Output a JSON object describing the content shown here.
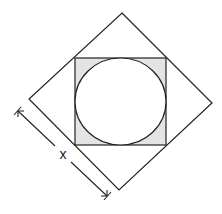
{
  "diagram": {
    "type": "geometry",
    "outer_square": {
      "rotation_deg": 45,
      "vertices": {
        "top": [
          122,
          13
        ],
        "right": [
          212,
          103
        ],
        "bottom": [
          119,
          190
        ],
        "left": [
          29,
          99
        ]
      },
      "stroke": "#222222"
    },
    "inner_square": {
      "x": 75,
      "y": 58,
      "width": 91,
      "height": 87,
      "fill": "#e4e4e4",
      "stroke": "#222222"
    },
    "circle": {
      "cx": 120.5,
      "cy": 101.5,
      "rx": 45.5,
      "ry": 43.5,
      "fill": "#ffffff",
      "stroke": "#222222"
    },
    "dimension": {
      "label": "x",
      "label_position": [
        63,
        154
      ],
      "start": [
        17,
        110
      ],
      "end": [
        108,
        197
      ],
      "measures": "side length of outer square"
    }
  }
}
